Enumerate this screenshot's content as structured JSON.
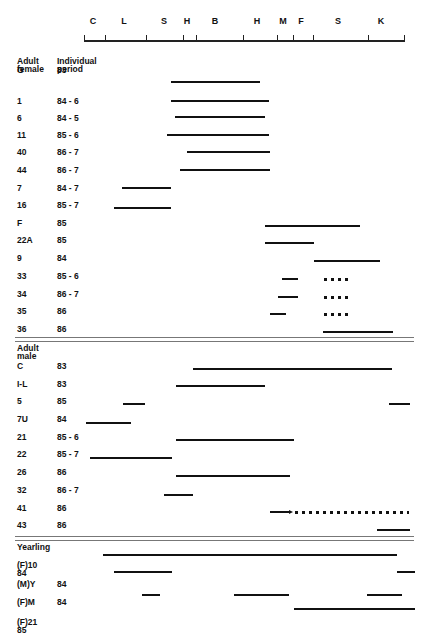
{
  "chart_data": {
    "type": "timeline",
    "title": "",
    "axis": {
      "labels": [
        "C",
        "L",
        "S",
        "H",
        "B",
        "H",
        "M",
        "F",
        "S",
        "K"
      ],
      "label_x": [
        93,
        124,
        164,
        187,
        215,
        257,
        283,
        301,
        338,
        381
      ],
      "ticks_x": [
        84,
        105,
        146,
        183,
        196,
        243,
        277,
        293,
        313,
        368,
        404
      ],
      "x_start": 84,
      "x_end": 405
    },
    "columns": {
      "group_header": "",
      "period_header": "Individual\nperiod"
    },
    "groups": [
      {
        "name": "Adult\nfemale",
        "rows": [
          {
            "id": "G",
            "period": "83",
            "segments": [
              {
                "x1": 171,
                "x2": 260,
                "style": "solid"
              }
            ]
          },
          {
            "id": "1",
            "period": "84 - 6",
            "segments": [
              {
                "x1": 171,
                "x2": 269,
                "style": "solid"
              }
            ]
          },
          {
            "id": "6",
            "period": "84 - 5",
            "segments": [
              {
                "x1": 175,
                "x2": 265,
                "style": "solid"
              }
            ]
          },
          {
            "id": "11",
            "period": "85 - 6",
            "segments": [
              {
                "x1": 167,
                "x2": 269,
                "style": "solid"
              }
            ]
          },
          {
            "id": "40",
            "period": "86 - 7",
            "segments": [
              {
                "x1": 187,
                "x2": 270,
                "style": "solid"
              }
            ]
          },
          {
            "id": "44",
            "period": "86 - 7",
            "segments": [
              {
                "x1": 180,
                "x2": 270,
                "style": "solid"
              }
            ]
          },
          {
            "id": "7",
            "period": "84 - 7",
            "segments": [
              {
                "x1": 122,
                "x2": 171,
                "style": "solid"
              }
            ]
          },
          {
            "id": "16",
            "period": "85 - 7",
            "segments": [
              {
                "x1": 114,
                "x2": 171,
                "style": "solid"
              }
            ]
          },
          {
            "id": "F",
            "period": "85",
            "segments": [
              {
                "x1": 265,
                "x2": 360,
                "style": "solid"
              }
            ]
          },
          {
            "id": "22A",
            "period": "85",
            "segments": [
              {
                "x1": 265,
                "x2": 314,
                "style": "solid"
              }
            ]
          },
          {
            "id": "9",
            "period": "84",
            "segments": [
              {
                "x1": 314,
                "x2": 380,
                "style": "solid"
              }
            ]
          },
          {
            "id": "33",
            "period": "85 - 6",
            "segments": [
              {
                "x1": 282,
                "x2": 298,
                "style": "solid"
              },
              {
                "x1": 324,
                "x2": 351,
                "style": "dotted"
              }
            ]
          },
          {
            "id": "34",
            "period": "86 - 7",
            "segments": [
              {
                "x1": 278,
                "x2": 298,
                "style": "solid"
              },
              {
                "x1": 324,
                "x2": 351,
                "style": "dotted"
              }
            ]
          },
          {
            "id": "35",
            "period": "86",
            "segments": [
              {
                "x1": 270,
                "x2": 286,
                "style": "solid"
              },
              {
                "x1": 324,
                "x2": 351,
                "style": "dotted"
              }
            ]
          },
          {
            "id": "36",
            "period": "86",
            "segments": [
              {
                "x1": 323,
                "x2": 393,
                "style": "solid"
              }
            ]
          }
        ]
      },
      {
        "name": "Adult\nmale",
        "rows": [
          {
            "id": "C",
            "period": "83",
            "segments": [
              {
                "x1": 193,
                "x2": 392,
                "style": "solid"
              }
            ]
          },
          {
            "id": "I-L",
            "period": "83",
            "segments": [
              {
                "x1": 176,
                "x2": 265,
                "style": "solid"
              }
            ]
          },
          {
            "id": "5",
            "period": "85",
            "segments": [
              {
                "x1": 123,
                "x2": 145,
                "style": "solid"
              },
              {
                "x1": 389,
                "x2": 410,
                "style": "solid"
              }
            ]
          },
          {
            "id": "7U",
            "period": "84",
            "segments": [
              {
                "x1": 86,
                "x2": 131,
                "style": "solid"
              }
            ]
          },
          {
            "id": "21",
            "period": "85 - 6",
            "segments": [
              {
                "x1": 176,
                "x2": 294,
                "style": "solid"
              }
            ]
          },
          {
            "id": "22",
            "period": "85 - 7",
            "segments": [
              {
                "x1": 90,
                "x2": 172,
                "style": "solid"
              }
            ]
          },
          {
            "id": "26",
            "period": "86",
            "segments": [
              {
                "x1": 176,
                "x2": 290,
                "style": "solid"
              }
            ]
          },
          {
            "id": "32",
            "period": "86 - 7",
            "segments": [
              {
                "x1": 164,
                "x2": 193,
                "style": "solid"
              }
            ]
          },
          {
            "id": "41",
            "period": "86",
            "segments": [
              {
                "x1": 270,
                "x2": 291,
                "style": "arrow"
              },
              {
                "x1": 295,
                "x2": 409,
                "style": "dotted"
              }
            ]
          },
          {
            "id": "43",
            "period": "86",
            "segments": [
              {
                "x1": 377,
                "x2": 410,
                "style": "solid"
              }
            ]
          }
        ]
      },
      {
        "name": "Yearling",
        "rows": [
          {
            "id": "(F)10\n84",
            "period": "",
            "segments": [
              {
                "x1": 103,
                "x2": 397,
                "style": "solid"
              }
            ]
          },
          {
            "id": "",
            "period": "",
            "segments": [
              {
                "x1": 114,
                "x2": 172,
                "style": "solid"
              },
              {
                "x1": 397,
                "x2": 415,
                "style": "solid"
              }
            ]
          },
          {
            "id": "(M)Y",
            "period": "84",
            "segments": []
          },
          {
            "id": "(F)M",
            "period": "84",
            "segments": [
              {
                "x1": 142,
                "x2": 160,
                "style": "solid"
              },
              {
                "x1": 234,
                "x2": 289,
                "style": "solid"
              },
              {
                "x1": 367,
                "x2": 402,
                "style": "solid"
              }
            ]
          },
          {
            "id": "(F)21\n85",
            "period": "",
            "segments": [
              {
                "x1": 294,
                "x2": 415,
                "style": "solid"
              }
            ]
          }
        ]
      }
    ]
  }
}
